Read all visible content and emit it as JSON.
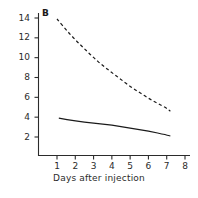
{
  "chart_data": {
    "type": "line",
    "title": "",
    "panel_label": "B",
    "xlabel": "Days after injection",
    "ylabel": "",
    "xlim": [
      0.35,
      8.4
    ],
    "ylim": [
      0.6,
      15.2
    ],
    "xticks": [
      1,
      2,
      3,
      4,
      5,
      6,
      7,
      8
    ],
    "xtick_labels": [
      "1",
      "2",
      "3",
      "4",
      "5",
      "6",
      "7",
      "8"
    ],
    "yticks": [
      2,
      4,
      6,
      8,
      10,
      12,
      14
    ],
    "ytick_labels": [
      "2",
      "4",
      "6",
      "8",
      "10",
      "12",
      "14"
    ],
    "grid": false,
    "legend": null,
    "series": [
      {
        "name": "dashed-curve",
        "style": "dashed",
        "color": "#1a1a1a",
        "x": [
          1.0,
          1.5,
          2.0,
          2.5,
          3.0,
          3.5,
          4.0,
          4.5,
          5.0,
          5.5,
          6.0,
          6.5,
          7.0,
          7.2
        ],
        "values": [
          13.9,
          12.8,
          11.8,
          10.9,
          10.0,
          9.2,
          8.5,
          7.8,
          7.1,
          6.5,
          5.9,
          5.4,
          4.9,
          4.6
        ]
      },
      {
        "name": "solid-curve",
        "style": "solid",
        "color": "#1a1a1a",
        "x": [
          1.1,
          2.0,
          3.0,
          4.0,
          5.0,
          6.0,
          7.0,
          7.2
        ],
        "values": [
          3.9,
          3.6,
          3.4,
          3.2,
          2.9,
          2.6,
          2.2,
          2.1
        ]
      }
    ]
  },
  "axes": {
    "x_axis_name": "x-axis",
    "y_axis_name": "y-axis"
  }
}
